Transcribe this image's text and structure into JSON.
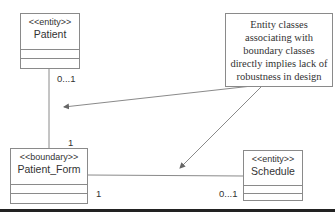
{
  "classes": {
    "patient": {
      "stereotype": "<<entity>>",
      "name": "Patient"
    },
    "patient_form": {
      "stereotype": "<<boundary>>",
      "name": "Patient_Form"
    },
    "schedule": {
      "stereotype": "<<entity>>",
      "name": "Schedule"
    }
  },
  "note": {
    "text": "Entity classes associating with boundary classes directly implies lack of robustness in design"
  },
  "associations": {
    "patient_to_form": {
      "patient_end": "0...1",
      "form_end": "1"
    },
    "form_to_schedule": {
      "form_end": "1",
      "schedule_end": "0...1"
    }
  },
  "colors": {
    "line": "#8a8a8a",
    "text": "#333333",
    "rule": "#222222"
  }
}
